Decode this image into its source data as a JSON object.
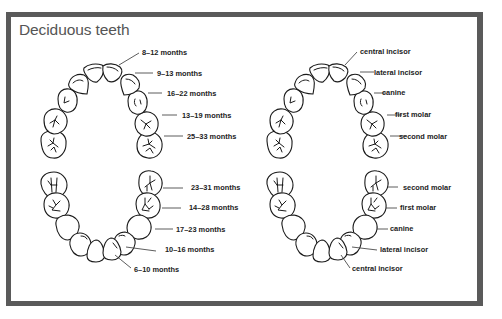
{
  "title": "Deciduous teeth",
  "diagrams": {
    "upper_eruption": {
      "labels": [
        "8–12 months",
        "9–13 months",
        "16–22 months",
        "13–19 months",
        "25–33 months"
      ]
    },
    "upper_names": {
      "labels": [
        "central incisor",
        "lateral incisor",
        "canine",
        "first molar",
        "second molar"
      ]
    },
    "lower_eruption": {
      "labels": [
        "23–31 months",
        "14–28 months",
        "17–23 months",
        "10–16 months",
        "6–10 months"
      ]
    },
    "lower_names": {
      "labels": [
        "second molar",
        "first molar",
        "canine",
        "lateral incisor",
        "central incisor"
      ]
    }
  },
  "colors": {
    "frame": "#5a5a5a",
    "title": "#555555",
    "ink": "#1a1a1a"
  }
}
